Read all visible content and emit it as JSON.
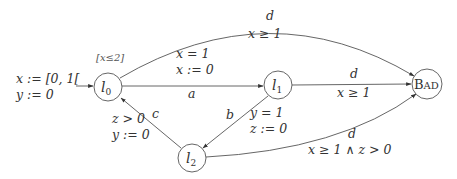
{
  "diagram": {
    "type": "timed-automaton",
    "colors": {
      "stroke": "#555555",
      "text": "#333333",
      "background": "#ffffff"
    },
    "initial": {
      "line1": "x := [0, 1[",
      "line2": "y := 0"
    },
    "states": [
      {
        "id": "l0",
        "base": "l",
        "sub": "0",
        "invariant": "[x≤2]"
      },
      {
        "id": "l1",
        "base": "l",
        "sub": "1"
      },
      {
        "id": "l2",
        "base": "l",
        "sub": "2"
      },
      {
        "id": "bad",
        "label_big": "B",
        "label_small": "AD"
      }
    ],
    "edges": [
      {
        "from": "l0",
        "to": "bad",
        "action": "d",
        "guard": "x ≥ 1"
      },
      {
        "from": "l0",
        "to": "l1",
        "action": "a",
        "guard": "x = 1",
        "reset": "x := 0"
      },
      {
        "from": "l1",
        "to": "bad",
        "action": "d",
        "guard": "x ≥ 1"
      },
      {
        "from": "l1",
        "to": "l2",
        "action": "b",
        "guard": "y = 1",
        "reset": "z := 0"
      },
      {
        "from": "l2",
        "to": "l0",
        "action": "c",
        "guard": "z > 0",
        "reset": "y := 0"
      },
      {
        "from": "l2",
        "to": "bad",
        "action": "d",
        "guard": "x ≥ 1 ∧ z > 0"
      }
    ]
  }
}
